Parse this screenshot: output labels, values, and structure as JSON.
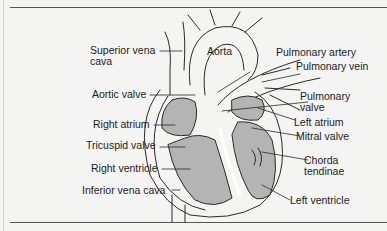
{
  "labels": {
    "superior_vena_cava": [
      "Superior vena",
      "cava"
    ],
    "aorta": "Aorta",
    "pulmonary_artery": "Pulmonary artery",
    "pulmonary_vein": "Pulmonary vein",
    "aortic_valve": "Aortic valve",
    "pulmonary_valve": [
      "Pulmonary",
      "valve"
    ],
    "right_atrium": "Right atrium",
    "left_atrium": "Left atrium",
    "tricuspid_valve": "Tricuspid valve",
    "mitral_valve": "Mitral valve",
    "right_ventricle": "Right ventricle",
    "chorda_tendinae": [
      "Chorda",
      "tendinae"
    ],
    "inferior_vena_cava": "Inferior vena cava",
    "left_ventricle": "Left ventricle"
  },
  "colors": {
    "chamber_fill": "#b4b4b4",
    "outline": "#2a2a2a",
    "background": "#f4f4f2"
  }
}
